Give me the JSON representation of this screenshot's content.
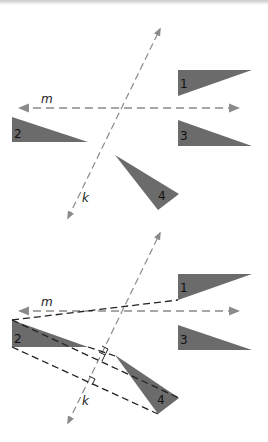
{
  "figure": {
    "colors": {
      "triangle_fill": "#6b6b6b",
      "axis_line": "#8a8a8a",
      "construction_line": "#222222",
      "background": "#ffffff"
    },
    "top_diagram": {
      "line_labels": {
        "m": "m",
        "k": "k"
      },
      "triangles": [
        {
          "label": "1"
        },
        {
          "label": "2"
        },
        {
          "label": "3"
        },
        {
          "label": "4"
        }
      ]
    },
    "bottom_diagram": {
      "line_labels": {
        "m": "m",
        "k": "k"
      },
      "triangles": [
        {
          "label": "1"
        },
        {
          "label": "2"
        },
        {
          "label": "3"
        },
        {
          "label": "4"
        }
      ]
    }
  }
}
